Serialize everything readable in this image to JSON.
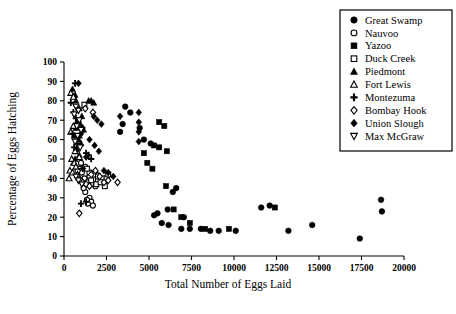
{
  "chart_data": {
    "type": "scatter",
    "title": "",
    "xlabel": "Total Number of Eggs Laid",
    "ylabel": "Percentage of Eggs Hatching",
    "xlim": [
      0,
      20000
    ],
    "ylim": [
      0,
      100
    ],
    "xticks": [
      0,
      2500,
      5000,
      7500,
      10000,
      12500,
      15000,
      17500,
      20000
    ],
    "yticks": [
      0,
      10,
      20,
      30,
      40,
      50,
      60,
      70,
      80,
      90,
      100
    ],
    "grid": false,
    "legend_position": "top-right",
    "series": [
      {
        "name": "Great Swamp",
        "marker": "filled-circle",
        "points": [
          [
            5300,
            21
          ],
          [
            5500,
            22
          ],
          [
            5750,
            17
          ],
          [
            6100,
            24
          ],
          [
            6150,
            16
          ],
          [
            6400,
            33
          ],
          [
            6600,
            35
          ],
          [
            6900,
            14
          ],
          [
            7050,
            20
          ],
          [
            7400,
            14
          ],
          [
            8050,
            14
          ],
          [
            8600,
            13
          ],
          [
            9100,
            13
          ],
          [
            10100,
            13
          ],
          [
            11600,
            25
          ],
          [
            12100,
            26
          ],
          [
            13200,
            13
          ],
          [
            14600,
            16
          ],
          [
            17400,
            9
          ],
          [
            18650,
            29
          ],
          [
            18700,
            23
          ],
          [
            4700,
            60
          ],
          [
            5100,
            58
          ],
          [
            4450,
            66
          ],
          [
            3900,
            74
          ],
          [
            3600,
            77
          ],
          [
            3450,
            68
          ],
          [
            3300,
            64
          ]
        ]
      },
      {
        "name": "Nauvoo",
        "marker": "open-circle",
        "points": [
          [
            900,
            45
          ],
          [
            1050,
            43
          ],
          [
            1200,
            40
          ],
          [
            1350,
            38
          ],
          [
            1500,
            41
          ],
          [
            1700,
            37
          ],
          [
            1850,
            36
          ],
          [
            1250,
            33
          ],
          [
            1500,
            30
          ],
          [
            1600,
            28
          ],
          [
            1700,
            26
          ],
          [
            1400,
            27
          ],
          [
            1150,
            35
          ],
          [
            2000,
            39
          ],
          [
            800,
            44
          ],
          [
            1000,
            48
          ],
          [
            1250,
            46
          ],
          [
            950,
            39
          ],
          [
            1900,
            42
          ],
          [
            1350,
            29
          ]
        ]
      },
      {
        "name": "Yazoo",
        "marker": "filled-square",
        "points": [
          [
            5300,
            57
          ],
          [
            5600,
            56
          ],
          [
            6050,
            54
          ],
          [
            4900,
            48
          ],
          [
            5200,
            45
          ],
          [
            6450,
            24
          ],
          [
            6900,
            20
          ],
          [
            7400,
            17
          ],
          [
            8300,
            14
          ],
          [
            9700,
            14
          ],
          [
            12400,
            25
          ],
          [
            5900,
            67
          ],
          [
            5600,
            69
          ],
          [
            6000,
            36
          ],
          [
            4700,
            53
          ]
        ]
      },
      {
        "name": "Duck Creek",
        "marker": "open-square",
        "points": [
          [
            1500,
            43
          ],
          [
            1750,
            42
          ],
          [
            2000,
            41
          ],
          [
            2250,
            40
          ],
          [
            2500,
            40
          ],
          [
            1900,
            37
          ],
          [
            2150,
            38
          ],
          [
            2400,
            36
          ],
          [
            1350,
            45
          ],
          [
            1200,
            78
          ],
          [
            1600,
            39
          ],
          [
            2600,
            42
          ]
        ]
      },
      {
        "name": "Piedmont",
        "marker": "filled-triangle",
        "points": [
          [
            500,
            86
          ],
          [
            650,
            83
          ],
          [
            700,
            80
          ],
          [
            1450,
            80
          ],
          [
            1600,
            80
          ],
          [
            1750,
            79
          ],
          [
            900,
            76
          ],
          [
            1050,
            72
          ],
          [
            800,
            70
          ],
          [
            950,
            68
          ],
          [
            700,
            66
          ],
          [
            1150,
            65
          ],
          [
            600,
            62
          ],
          [
            850,
            60
          ],
          [
            1000,
            58
          ],
          [
            750,
            55
          ],
          [
            900,
            52
          ],
          [
            650,
            50
          ],
          [
            550,
            48
          ]
        ]
      },
      {
        "name": "Fort Lewis",
        "marker": "open-triangle",
        "points": [
          [
            400,
            84
          ],
          [
            550,
            82
          ],
          [
            450,
            50
          ],
          [
            600,
            48
          ],
          [
            350,
            44
          ],
          [
            500,
            43
          ],
          [
            700,
            46
          ],
          [
            800,
            42
          ],
          [
            300,
            40
          ],
          [
            650,
            54
          ],
          [
            900,
            51
          ],
          [
            400,
            64
          ],
          [
            550,
            67
          ]
        ]
      },
      {
        "name": "Montezuma",
        "marker": "plus",
        "points": [
          [
            650,
            89
          ],
          [
            400,
            79
          ],
          [
            550,
            74
          ],
          [
            700,
            71
          ],
          [
            850,
            69
          ],
          [
            500,
            63
          ],
          [
            900,
            61
          ],
          [
            1300,
            53
          ],
          [
            1450,
            52
          ],
          [
            1100,
            45
          ],
          [
            1300,
            28
          ],
          [
            1000,
            27
          ],
          [
            750,
            58
          ],
          [
            600,
            56
          ],
          [
            1600,
            50
          ]
        ]
      },
      {
        "name": "Bombay Hook",
        "marker": "open-diamond",
        "points": [
          [
            1100,
            38
          ],
          [
            1300,
            37
          ],
          [
            1500,
            36
          ],
          [
            2600,
            39
          ],
          [
            2350,
            38
          ],
          [
            3150,
            38
          ],
          [
            900,
            22
          ],
          [
            1850,
            44
          ],
          [
            1600,
            42
          ],
          [
            2100,
            41
          ],
          [
            1250,
            76
          ],
          [
            1700,
            74
          ]
        ]
      },
      {
        "name": "Union Slough",
        "marker": "filled-diamond",
        "points": [
          [
            850,
            89
          ],
          [
            4400,
            74
          ],
          [
            4400,
            69
          ],
          [
            4400,
            64
          ],
          [
            4400,
            59
          ],
          [
            3300,
            72
          ],
          [
            1750,
            72
          ],
          [
            1950,
            70
          ],
          [
            2200,
            68
          ],
          [
            1500,
            60
          ],
          [
            1800,
            57
          ],
          [
            2050,
            54
          ],
          [
            1300,
            51
          ],
          [
            2350,
            44
          ],
          [
            2600,
            43
          ],
          [
            2900,
            41
          ],
          [
            1100,
            66
          ],
          [
            1000,
            63
          ]
        ]
      },
      {
        "name": "Max McGraw",
        "marker": "open-inverted-triangle",
        "points": [
          [
            700,
            77
          ],
          [
            850,
            75
          ],
          [
            600,
            73
          ],
          [
            900,
            70
          ],
          [
            750,
            67
          ],
          [
            1000,
            65
          ],
          [
            800,
            62
          ],
          [
            650,
            59
          ],
          [
            950,
            56
          ],
          [
            700,
            41
          ],
          [
            850,
            39
          ],
          [
            1050,
            37
          ]
        ]
      }
    ]
  },
  "legend": {
    "items": [
      {
        "label": "Great Swamp",
        "marker": "filled-circle"
      },
      {
        "label": "Nauvoo",
        "marker": "open-circle"
      },
      {
        "label": "Yazoo",
        "marker": "filled-square"
      },
      {
        "label": "Duck Creek",
        "marker": "open-square"
      },
      {
        "label": "Piedmont",
        "marker": "filled-triangle"
      },
      {
        "label": "Fort Lewis",
        "marker": "open-triangle"
      },
      {
        "label": "Montezuma",
        "marker": "plus"
      },
      {
        "label": "Bombay Hook",
        "marker": "open-diamond"
      },
      {
        "label": "Union Slough",
        "marker": "filled-diamond"
      },
      {
        "label": "Max McGraw",
        "marker": "open-inverted-triangle"
      }
    ]
  },
  "colors": {
    "ink": "#000000",
    "background": "#ffffff"
  }
}
